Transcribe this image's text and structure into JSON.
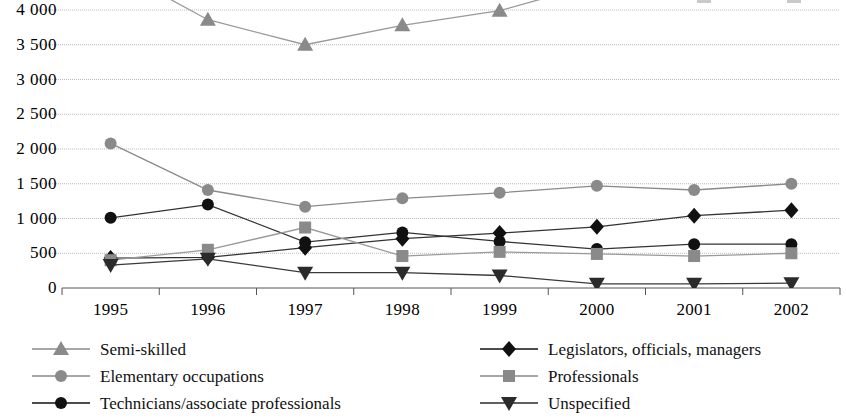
{
  "chart_data": {
    "type": "line",
    "title": "",
    "xlabel": "",
    "ylabel": "",
    "categories": [
      "1995",
      "1996",
      "1997",
      "1998",
      "1999",
      "2000",
      "2001",
      "2002"
    ],
    "ylim": [
      0,
      4000
    ],
    "yticks": [
      0,
      500,
      1000,
      1500,
      2000,
      2500,
      3000,
      3500,
      4000
    ],
    "ytick_labels": [
      "0",
      "500",
      "1 000",
      "1 500",
      "2 000",
      "2 500",
      "3 000",
      "3 500",
      "4 000"
    ],
    "grid": true,
    "grid_axis": "y",
    "legend_position": "below",
    "legend_columns": 2,
    "clipped_top": true,
    "series": [
      {
        "name": "Semi-skilled",
        "marker": "triangle-up",
        "color": "#8a8a8a",
        "line_color": "#9a9a9a",
        "values": [
          4620,
          3860,
          3500,
          3780,
          3990,
          4380,
          4760,
          5100
        ]
      },
      {
        "name": "Elementary occupations",
        "marker": "circle",
        "color": "#8a8a8a",
        "line_color": "#8a8a8a",
        "values": [
          2080,
          1410,
          1170,
          1290,
          1370,
          1470,
          1410,
          1500
        ]
      },
      {
        "name": "Technicians/associate professionals",
        "marker": "circle",
        "color": "#111111",
        "line_color": "#333333",
        "values": [
          1010,
          1200,
          660,
          800,
          670,
          560,
          630,
          630
        ]
      },
      {
        "name": "Legislators, officials, managers",
        "marker": "diamond",
        "color": "#111111",
        "line_color": "#333333",
        "values": [
          430,
          440,
          580,
          710,
          790,
          880,
          1040,
          1120
        ]
      },
      {
        "name": "Professionals",
        "marker": "square",
        "color": "#8a8a8a",
        "line_color": "#9a9a9a",
        "values": [
          400,
          550,
          870,
          460,
          520,
          490,
          460,
          500
        ]
      },
      {
        "name": "Unspecified",
        "marker": "triangle-down",
        "color": "#2b2b2b",
        "line_color": "#3a3a3a",
        "values": [
          330,
          420,
          220,
          220,
          180,
          60,
          60,
          70
        ]
      }
    ]
  },
  "axis": {
    "y_tick_labels": [
      "4 000",
      "3 500",
      "3 000",
      "2 500",
      "2 000",
      "1 500",
      "1 000",
      "500",
      "0"
    ],
    "x_tick_labels": [
      "1995",
      "1996",
      "1997",
      "1998",
      "1999",
      "2000",
      "2001",
      "2002"
    ]
  },
  "legend": {
    "items": [
      {
        "label": "Semi-skilled",
        "marker": "triangle-up",
        "color": "#8a8a8a"
      },
      {
        "label": "Legislators, officials, managers",
        "marker": "diamond",
        "color": "#111111"
      },
      {
        "label": "Elementary occupations",
        "marker": "circle",
        "color": "#8a8a8a"
      },
      {
        "label": "Professionals",
        "marker": "square",
        "color": "#8a8a8a"
      },
      {
        "label": "Technicians/associate professionals",
        "marker": "circle",
        "color": "#111111"
      },
      {
        "label": "Unspecified",
        "marker": "triangle-down",
        "color": "#2b2b2b"
      }
    ]
  },
  "colors": {
    "gray_series": "#8a8a8a",
    "black_series": "#111111",
    "dark_series": "#2b2b2b",
    "gridline": "#b9b9b9",
    "axis": "#555555",
    "background": "#ffffff"
  }
}
